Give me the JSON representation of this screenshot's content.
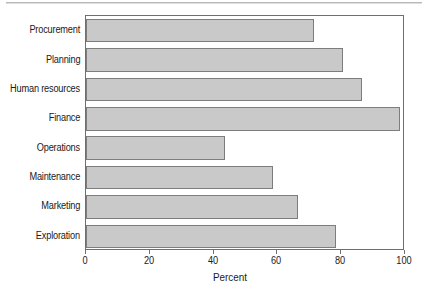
{
  "chart_data": {
    "type": "bar",
    "orientation": "horizontal",
    "title": "",
    "subtitle": "",
    "xlabel": "Percent",
    "ylabel": "",
    "categories": [
      "Procurement",
      "Planning",
      "Human resources",
      "Finance",
      "Operations",
      "Maintenance",
      "Marketing",
      "Exploration"
    ],
    "values": [
      72,
      81,
      87,
      99,
      44,
      59,
      67,
      79
    ],
    "xlim": [
      0,
      100
    ],
    "xticks": [
      0,
      20,
      40,
      60,
      80,
      100
    ],
    "xtick_labels": [
      "0",
      "20",
      "40",
      "60",
      "80",
      "100"
    ],
    "grid": false,
    "legend": false,
    "legend_position": "none",
    "bar_fill_color": "#c9c9c9",
    "bar_edge_color": "#7d7d7d",
    "frame_color": "#6f6f6f"
  },
  "axes": {
    "x_title": "Percent"
  }
}
